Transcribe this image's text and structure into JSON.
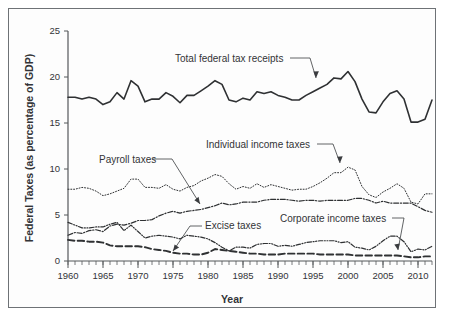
{
  "figure": {
    "ylabel": "Federal Taxes (as percentage of GDP)",
    "xlabel": "Year"
  },
  "axes": {
    "y_ticks": [
      "0",
      "5",
      "10",
      "15",
      "20",
      "25"
    ],
    "x_ticks": [
      "1960",
      "1965",
      "1970",
      "1975",
      "1980",
      "1985",
      "1990",
      "1995",
      "2000",
      "2005",
      "2010"
    ]
  },
  "annotations": [
    {
      "name": "total-federal-tax-receipts",
      "label": "Total federal tax receipts"
    },
    {
      "name": "individual-income-taxes",
      "label": "Individual income taxes"
    },
    {
      "name": "payroll-taxes",
      "label": "Payroll taxes"
    },
    {
      "name": "excise-taxes",
      "label": "Excise taxes"
    },
    {
      "name": "corporate-income-taxes",
      "label": "Corporate income taxes"
    }
  ],
  "chart_data": {
    "type": "line",
    "title": "",
    "xlabel": "Year",
    "ylabel": "Federal Taxes (as percentage of GDP)",
    "xlim": [
      1960,
      2012
    ],
    "ylim": [
      0,
      25
    ],
    "y_ticks": [
      0,
      5,
      10,
      15,
      20,
      25
    ],
    "x_ticks": [
      1960,
      1965,
      1970,
      1975,
      1980,
      1985,
      1990,
      1995,
      2000,
      2005,
      2010
    ],
    "x_minor_tick_interval": 1,
    "grid": false,
    "legend": "annotated-inline",
    "x": [
      1960,
      1961,
      1962,
      1963,
      1964,
      1965,
      1966,
      1967,
      1968,
      1969,
      1970,
      1971,
      1972,
      1973,
      1974,
      1975,
      1976,
      1977,
      1978,
      1979,
      1980,
      1981,
      1982,
      1983,
      1984,
      1985,
      1986,
      1987,
      1988,
      1989,
      1990,
      1991,
      1992,
      1993,
      1994,
      1995,
      1996,
      1997,
      1998,
      1999,
      2000,
      2001,
      2002,
      2003,
      2004,
      2005,
      2006,
      2007,
      2008,
      2009,
      2010,
      2011,
      2012
    ],
    "series": [
      {
        "name": "Total federal tax receipts",
        "style": "solid",
        "color": "#2f3133",
        "width": 1.6,
        "values": [
          17.8,
          17.8,
          17.6,
          17.8,
          17.6,
          17.0,
          17.3,
          18.3,
          17.6,
          19.6,
          19.0,
          17.3,
          17.6,
          17.6,
          18.3,
          17.9,
          17.2,
          18.0,
          18.0,
          18.5,
          19.0,
          19.6,
          19.2,
          17.5,
          17.3,
          17.7,
          17.5,
          18.4,
          18.2,
          18.4,
          18.0,
          17.8,
          17.5,
          17.5,
          18.0,
          18.4,
          18.8,
          19.2,
          19.9,
          19.8,
          20.6,
          19.5,
          17.6,
          16.2,
          16.1,
          17.3,
          18.2,
          18.5,
          17.6,
          15.1,
          15.1,
          15.4,
          17.5
        ]
      },
      {
        "name": "Individual income taxes",
        "style": "dotted",
        "color": "#4b4d50",
        "width": 1.0,
        "values": [
          7.8,
          7.8,
          8.0,
          7.9,
          7.6,
          7.1,
          7.3,
          7.6,
          7.9,
          8.9,
          8.9,
          8.0,
          8.0,
          7.9,
          8.3,
          7.8,
          7.6,
          8.0,
          8.2,
          8.7,
          9.0,
          9.4,
          9.2,
          8.4,
          7.8,
          8.1,
          7.9,
          8.4,
          8.0,
          8.3,
          8.1,
          7.9,
          7.7,
          7.8,
          7.8,
          8.1,
          8.5,
          9.0,
          9.6,
          9.6,
          10.2,
          9.9,
          8.1,
          7.2,
          6.9,
          7.5,
          7.9,
          8.4,
          7.9,
          6.4,
          6.2,
          7.3,
          7.3
        ]
      },
      {
        "name": "Payroll taxes",
        "style": "dashdot",
        "color": "#3f4144",
        "width": 1.2,
        "values": [
          2.8,
          3.1,
          3.0,
          3.3,
          3.4,
          3.2,
          3.8,
          4.0,
          3.9,
          4.1,
          4.4,
          4.4,
          4.5,
          4.9,
          5.2,
          5.4,
          5.2,
          5.4,
          5.5,
          5.6,
          5.8,
          6.0,
          6.3,
          6.1,
          6.2,
          6.4,
          6.4,
          6.4,
          6.6,
          6.7,
          6.7,
          6.7,
          6.6,
          6.5,
          6.6,
          6.6,
          6.5,
          6.6,
          6.6,
          6.6,
          6.6,
          6.8,
          6.8,
          6.6,
          6.3,
          6.5,
          6.3,
          6.3,
          6.3,
          6.3,
          5.9,
          5.5,
          5.3
        ]
      },
      {
        "name": "Corporate income taxes",
        "style": "dashdotdot",
        "color": "#3f4144",
        "width": 1.2,
        "values": [
          4.2,
          3.9,
          3.6,
          3.6,
          3.7,
          3.7,
          4.0,
          4.2,
          3.3,
          3.9,
          3.2,
          2.5,
          2.7,
          2.8,
          2.7,
          2.6,
          2.4,
          2.8,
          2.7,
          2.6,
          2.4,
          2.0,
          1.5,
          1.1,
          1.5,
          1.5,
          1.4,
          1.8,
          1.9,
          1.9,
          1.6,
          1.7,
          1.6,
          1.8,
          2.0,
          2.1,
          2.2,
          2.2,
          2.2,
          2.0,
          2.1,
          1.5,
          1.4,
          1.2,
          1.6,
          2.2,
          2.7,
          2.7,
          2.1,
          1.0,
          1.3,
          1.2,
          1.6
        ]
      },
      {
        "name": "Excise taxes",
        "style": "longdash",
        "color": "#2f3133",
        "width": 1.9,
        "values": [
          2.3,
          2.2,
          2.2,
          2.1,
          2.1,
          2.0,
          1.7,
          1.6,
          1.6,
          1.6,
          1.6,
          1.5,
          1.3,
          1.2,
          1.1,
          0.9,
          0.8,
          0.8,
          0.7,
          0.7,
          0.9,
          1.3,
          1.2,
          1.1,
          1.0,
          0.9,
          0.8,
          0.8,
          0.7,
          0.7,
          0.7,
          0.8,
          0.8,
          0.8,
          0.8,
          0.8,
          0.7,
          0.7,
          0.7,
          0.7,
          0.7,
          0.6,
          0.6,
          0.6,
          0.6,
          0.6,
          0.6,
          0.6,
          0.5,
          0.4,
          0.4,
          0.5,
          0.5
        ]
      }
    ]
  }
}
